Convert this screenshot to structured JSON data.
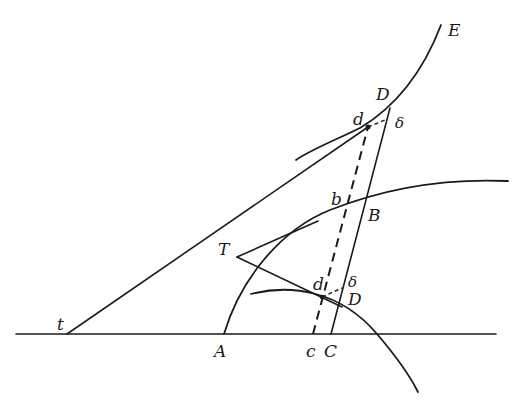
{
  "figure": {
    "type": "geometric construction",
    "labels": {
      "E": "E",
      "D_upper": "D",
      "d_upper": "d",
      "delta_upper": "δ",
      "b": "b",
      "B": "B",
      "T": "T",
      "d_lower": "d",
      "delta_lower": "δ",
      "D_lower": "D",
      "t": "t",
      "A": "A",
      "c": "c",
      "C": "C"
    },
    "colors": {
      "ink": "#1a1a1a",
      "background": "#ffffff"
    }
  }
}
